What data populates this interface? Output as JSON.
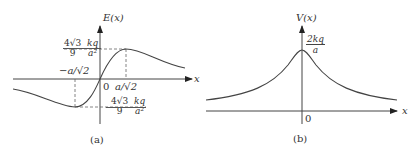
{
  "panel_a": {
    "caption": "(a)",
    "y_axis_label": "E(x)",
    "x_axis_label": "x",
    "origin_label": "0",
    "max_x_label": "a/√2",
    "min_x_label": "−a/√2",
    "max_value": {
      "coef_num": "4√3",
      "coef_den": "9",
      "var_num": "kq",
      "var_den": "a²"
    },
    "min_value": {
      "coef_num": "4√3",
      "coef_den": "9",
      "var_num": "kq",
      "var_den": "a²"
    }
  },
  "panel_b": {
    "caption": "(b)",
    "y_axis_label": "V(x)",
    "x_axis_label": "x",
    "origin_label": "0",
    "peak_value": {
      "num": "2kq",
      "den": "a"
    }
  },
  "colors": {
    "line": "#444444",
    "dash": "#666666",
    "text": "#333333"
  }
}
